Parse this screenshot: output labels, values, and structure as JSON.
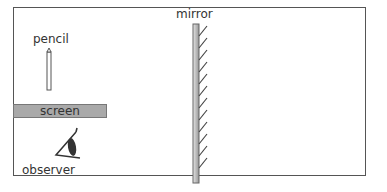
{
  "diagram": {
    "type": "optics-plane-mirror",
    "labels": {
      "mirror": "mirror",
      "pencil": "pencil",
      "screen": "screen",
      "observer": "observer"
    },
    "elements": [
      {
        "id": "pencil",
        "kind": "object",
        "label": "pencil"
      },
      {
        "id": "screen",
        "kind": "opaque-barrier",
        "label": "screen"
      },
      {
        "id": "observer",
        "kind": "eye",
        "label": "observer"
      },
      {
        "id": "mirror",
        "kind": "plane-mirror",
        "label": "mirror",
        "hatch_side": "right"
      }
    ],
    "colors": {
      "frame": "#555555",
      "screen_fill": "#a9a9a9",
      "mirror_fill": "#c8c8c8",
      "ink": "#333333"
    }
  }
}
